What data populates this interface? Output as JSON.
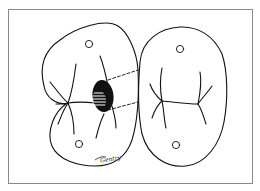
{
  "figure": {
    "signature": "Gentry",
    "colors": {
      "line": "#111111",
      "frame": "#8a8a8a",
      "background": "#ffffff"
    }
  }
}
